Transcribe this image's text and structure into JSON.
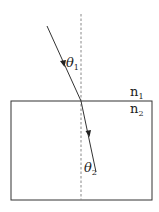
{
  "diagram": {
    "type": "refraction",
    "labels": {
      "theta1": "θ",
      "theta1_sub": "1",
      "theta2": "θ",
      "theta2_sub": "2",
      "n1": "n",
      "n1_sub": "1",
      "n2": "n",
      "n2_sub": "2"
    },
    "colors": {
      "line": "#333333",
      "normal": "#888888",
      "background": "#ffffff"
    },
    "geometry": {
      "normal_x": 81,
      "interface_y": 101,
      "medium2_rect": {
        "x": 11,
        "y": 101,
        "w": 141,
        "h": 99
      },
      "incident_ray": {
        "x1": 47,
        "y1": 26,
        "x2": 81,
        "y2": 101
      },
      "refracted_ray": {
        "x1": 81,
        "y1": 101,
        "x2": 96,
        "y2": 172
      }
    }
  }
}
